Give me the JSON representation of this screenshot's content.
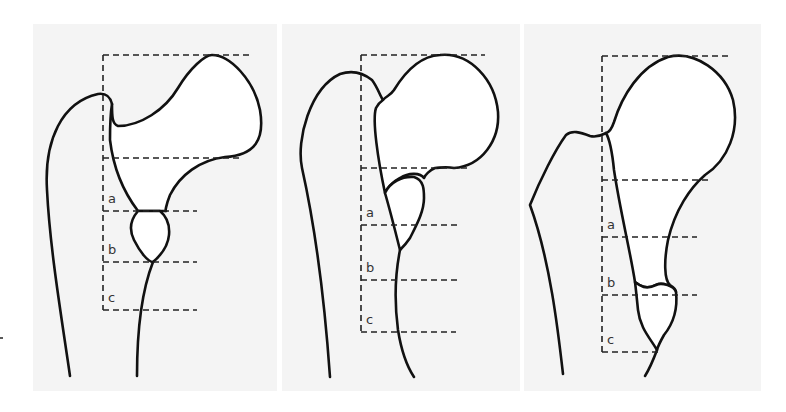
{
  "figure": {
    "panels": [
      {
        "id": "panel-1",
        "labels": [
          "a",
          "b",
          "c"
        ]
      },
      {
        "id": "panel-2",
        "labels": [
          "a",
          "b",
          "c"
        ]
      },
      {
        "id": "panel-3",
        "labels": [
          "a",
          "b",
          "c"
        ]
      }
    ],
    "colors": {
      "background": "#ffffff",
      "panel_background": "#f4f4f4",
      "outline": "#111111",
      "dash": "#222222",
      "label": "#333333"
    }
  }
}
